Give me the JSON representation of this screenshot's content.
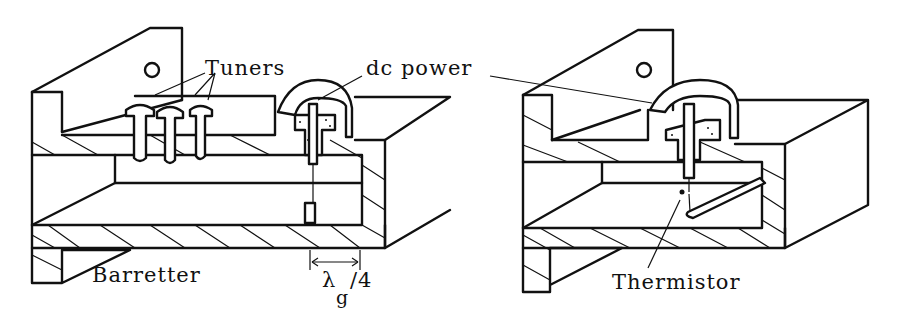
{
  "figure": {
    "left_panel": {
      "name": "Barretter mount",
      "labels": {
        "tuners": "Tuners",
        "dc_power": "dc power",
        "device": "Barretter",
        "lambda": "λ",
        "lambda_sub": "g",
        "lambda_suffix": "/4"
      }
    },
    "right_panel": {
      "name": "Thermistor mount",
      "labels": {
        "device": "Thermistor"
      }
    },
    "colors": {
      "ink": "#111111",
      "background": "#ffffff"
    }
  }
}
